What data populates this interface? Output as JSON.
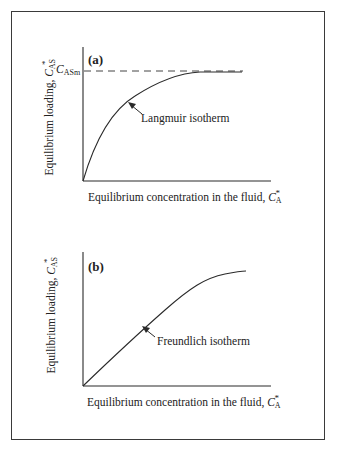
{
  "panels": [
    {
      "tag": "(a)",
      "ylabel_text": "Equilibrium loading, ",
      "ylabel_symbol": "C",
      "ylabel_sub": "AS",
      "ylabel_sup": "*",
      "xlabel_text": "Equilibrium concentration in the fluid, ",
      "xlabel_symbol": "C",
      "xlabel_sub": "A",
      "xlabel_sup": "*",
      "asymptote_symbol": "C",
      "asymptote_sub": "ASm",
      "annotation": "Langmuir isotherm"
    },
    {
      "tag": "(b)",
      "ylabel_text": "Equilibrium loading, ",
      "ylabel_symbol": "C",
      "ylabel_sub": "AS",
      "ylabel_sup": "*",
      "xlabel_text": "Equilibrium concentration in the fluid, ",
      "xlabel_symbol": "C",
      "xlabel_sub": "A",
      "xlabel_sup": "*",
      "annotation": "Freundlich isotherm"
    }
  ],
  "colors": {
    "line": "#2a2a2a",
    "frame": "#3a3a3a"
  }
}
